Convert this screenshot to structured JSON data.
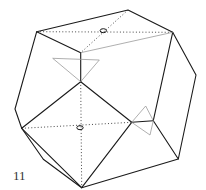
{
  "figure": {
    "label": "11",
    "colors": {
      "edge": "#1a1a1a",
      "hidden": "#333333",
      "guide": "#9a9a9a",
      "background": "#ffffff"
    }
  }
}
